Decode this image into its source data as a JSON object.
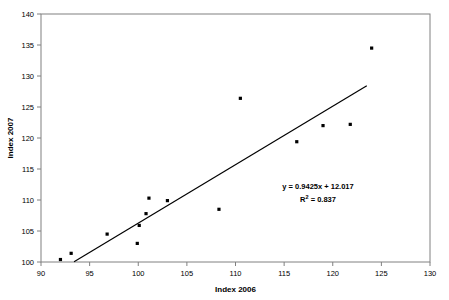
{
  "chart_data": {
    "type": "scatter",
    "title": "",
    "xlabel": "Index 2006",
    "ylabel": "Index 2007",
    "xlim": [
      90,
      130
    ],
    "ylim": [
      100,
      140
    ],
    "xticks": [
      90,
      95,
      100,
      105,
      110,
      115,
      120,
      125,
      130
    ],
    "yticks": [
      100,
      105,
      110,
      115,
      120,
      125,
      130,
      135,
      140
    ],
    "grid": false,
    "legend": false,
    "points": [
      {
        "x": 92.0,
        "y": 100.4
      },
      {
        "x": 93.1,
        "y": 101.4
      },
      {
        "x": 96.8,
        "y": 104.5
      },
      {
        "x": 99.9,
        "y": 103.0
      },
      {
        "x": 100.1,
        "y": 105.9
      },
      {
        "x": 100.8,
        "y": 107.8
      },
      {
        "x": 101.1,
        "y": 110.3
      },
      {
        "x": 103.0,
        "y": 109.9
      },
      {
        "x": 108.3,
        "y": 108.5
      },
      {
        "x": 110.5,
        "y": 126.4
      },
      {
        "x": 116.3,
        "y": 119.4
      },
      {
        "x": 119.0,
        "y": 122.0
      },
      {
        "x": 121.8,
        "y": 122.2
      },
      {
        "x": 124.0,
        "y": 134.5
      }
    ],
    "trendline": {
      "slope": 0.9425,
      "intercept": 12.017,
      "x_start": 93.4,
      "x_end": 123.5
    },
    "annotations": {
      "equation": "y = 0.9425x + 12.017",
      "r_squared_prefix": "R",
      "r_squared_sup": "2",
      "r_squared_value": " = 0.837"
    },
    "colors": {
      "point": "#000000",
      "line": "#000000",
      "frame": "#808080",
      "background": "#ffffff"
    }
  }
}
